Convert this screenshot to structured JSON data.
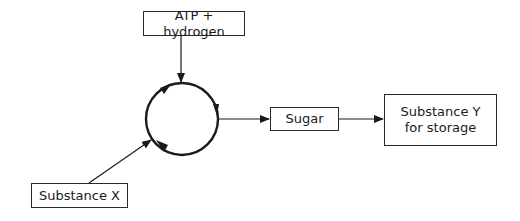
{
  "diagram": {
    "title": "",
    "nodes": {
      "atp": {
        "label": "ATP + hydrogen"
      },
      "cycle": {
        "label": "",
        "shape": "circle",
        "direction": "clockwise"
      },
      "sugar": {
        "label": "Sugar"
      },
      "substance_y": {
        "line1": "Substance Y",
        "line2": "for storage"
      },
      "substance_x": {
        "label": "Substance X"
      }
    },
    "edges": [
      {
        "from": "ATP + hydrogen",
        "to": "cycle"
      },
      {
        "from": "Substance X",
        "to": "cycle"
      },
      {
        "from": "cycle",
        "to": "Sugar"
      },
      {
        "from": "Sugar",
        "to": "Substance Y for storage"
      }
    ],
    "colors": {
      "stroke": "#1a1a1a",
      "background": "#ffffff"
    }
  }
}
